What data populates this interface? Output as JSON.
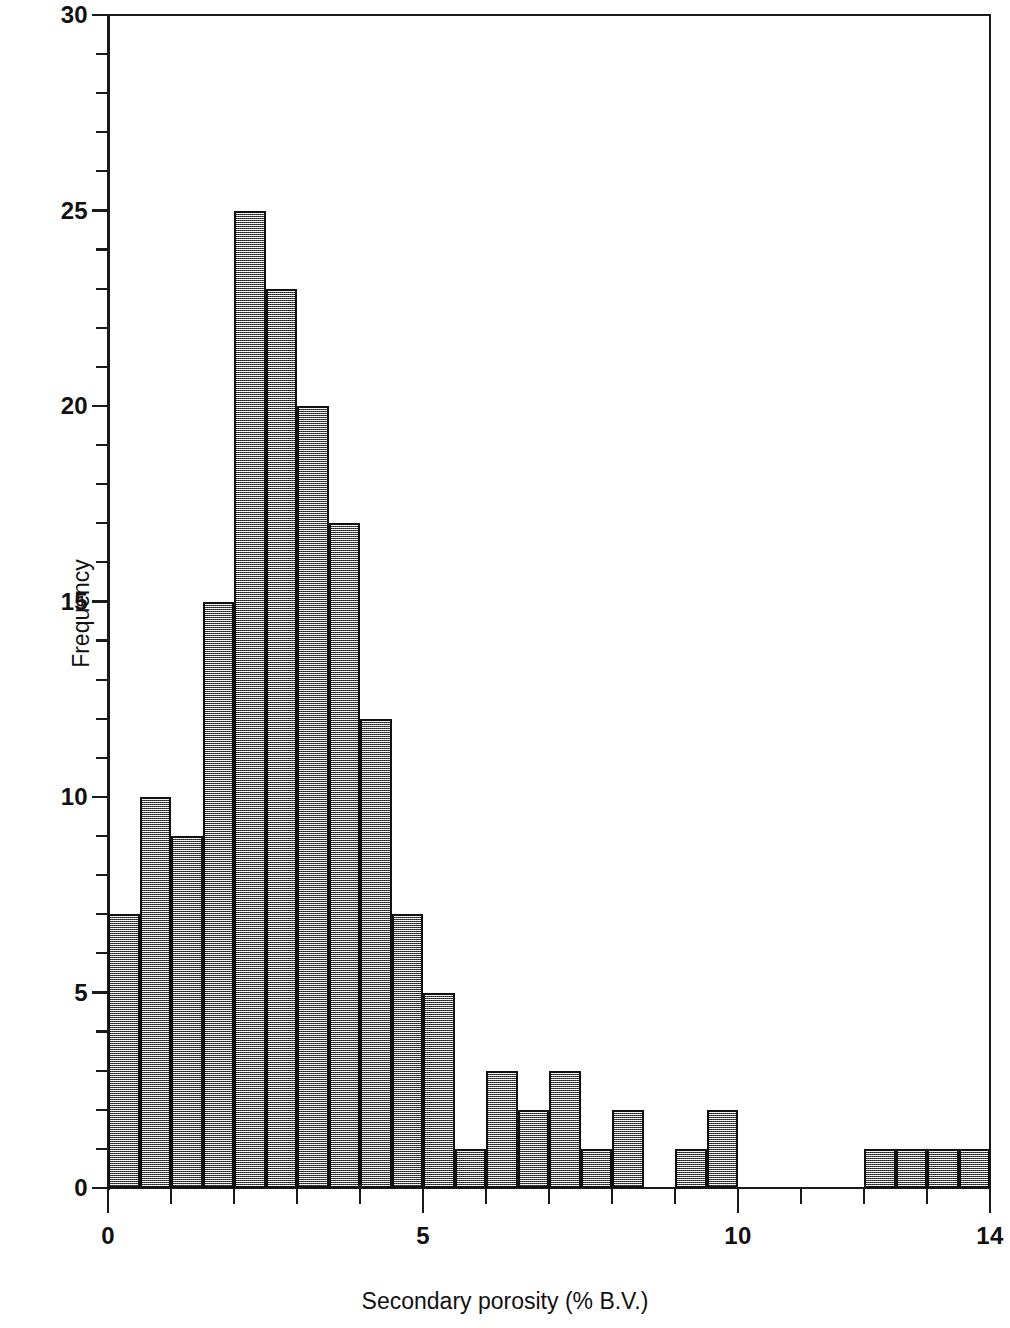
{
  "chart_data": {
    "type": "bar",
    "subtype": "histogram",
    "title": "",
    "xlabel": "Secondary porosity (% B.V.)",
    "ylabel": "Frequency",
    "xlim": [
      0,
      14
    ],
    "ylim": [
      0,
      30
    ],
    "bin_width": 0.5,
    "grid": false,
    "legend": null,
    "x_major_ticks": [
      0,
      5,
      10,
      14
    ],
    "x_major_tick_labels": [
      "0",
      "5",
      "10",
      "14"
    ],
    "x_minor_tick_step": 1,
    "y_major_ticks": [
      0,
      5,
      10,
      15,
      20,
      25,
      30
    ],
    "y_major_tick_labels": [
      "0",
      "5",
      "10",
      "15",
      "20",
      "25",
      "30"
    ],
    "y_minor_tick_step": 1,
    "bin_edges": [
      0,
      0.5,
      1.0,
      1.5,
      2.0,
      2.5,
      3.0,
      3.5,
      4.0,
      4.5,
      5.0,
      5.5,
      6.0,
      6.5,
      7.0,
      7.5,
      8.0,
      8.5,
      9.0,
      9.5,
      10.0,
      10.5,
      11.0,
      11.5,
      12.0,
      12.5,
      13.0,
      13.5,
      14.0
    ],
    "categories": [
      "0.0-0.5",
      "0.5-1.0",
      "1.0-1.5",
      "1.5-2.0",
      "2.0-2.5",
      "2.5-3.0",
      "3.0-3.5",
      "3.5-4.0",
      "4.0-4.5",
      "4.5-5.0",
      "5.0-5.5",
      "5.5-6.0",
      "6.0-6.5",
      "6.5-7.0",
      "7.0-7.5",
      "7.5-8.0",
      "8.0-8.5",
      "8.5-9.0",
      "9.0-9.5",
      "9.5-10.0",
      "10.0-10.5",
      "10.5-11.0",
      "11.0-11.5",
      "11.5-12.0",
      "12.0-12.5",
      "12.5-13.0",
      "13.0-13.5",
      "13.5-14.0"
    ],
    "values": [
      7,
      10,
      9,
      15,
      25,
      23,
      20,
      17,
      12,
      7,
      5,
      1,
      3,
      2,
      3,
      1,
      2,
      0,
      1,
      2,
      0,
      0,
      0,
      0,
      1,
      1,
      1,
      1
    ],
    "bar_fill_color": "#b9b9b9",
    "bar_edge_color": "#111111",
    "axis_color": "#111111",
    "background_color": "#ffffff"
  }
}
